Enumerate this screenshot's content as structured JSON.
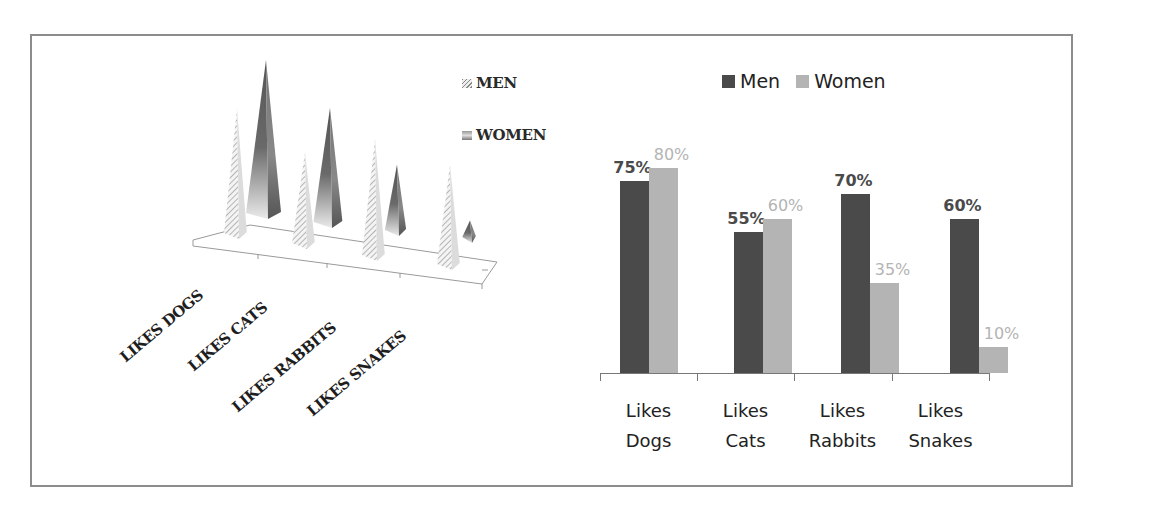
{
  "chart_data": [
    {
      "type": "bar",
      "subtype": "3d-pyramid",
      "title": "",
      "categories": [
        "LIKES DOGS",
        "LIKES CATS",
        "LIKES RABBITS",
        "LIKES SNAKES"
      ],
      "series": [
        {
          "name": "MEN",
          "values": [
            75,
            55,
            70,
            60
          ],
          "style": "hatched"
        },
        {
          "name": "WOMEN",
          "values": [
            80,
            60,
            35,
            10
          ],
          "style": "gradient"
        }
      ],
      "xlabel": "",
      "ylabel": "",
      "grid": false,
      "legend_position": "top-right",
      "data_labels": false
    },
    {
      "type": "bar",
      "title": "",
      "categories": [
        "Likes Dogs",
        "Likes Cats",
        "Likes Rabbits",
        "Likes Snakes"
      ],
      "series": [
        {
          "name": "Men",
          "values": [
            75,
            55,
            70,
            60
          ],
          "color": "#4a4a4a"
        },
        {
          "name": "Women",
          "values": [
            80,
            60,
            35,
            10
          ],
          "color": "#b4b4b4"
        }
      ],
      "value_labels": {
        "Men": [
          "75%",
          "55%",
          "70%",
          "60%"
        ],
        "Women": [
          "80%",
          "60%",
          "35%",
          "10%"
        ]
      },
      "xlabel": "",
      "ylabel": "",
      "ylim": [
        0,
        100
      ],
      "grid": false,
      "legend_position": "top"
    }
  ],
  "left_chart": {
    "legend": [
      {
        "label": "MEN"
      },
      {
        "label": "WOMEN"
      }
    ],
    "categories": [
      "LIKES DOGS",
      "LIKES CATS",
      "LIKES RABBITS",
      "LIKES SNAKES"
    ]
  },
  "right_chart": {
    "legend": [
      {
        "label": "Men",
        "color": "#4a4a4a"
      },
      {
        "label": "Women",
        "color": "#b4b4b4"
      }
    ],
    "categories": [
      {
        "line1": "Likes",
        "line2": "Dogs"
      },
      {
        "line1": "Likes",
        "line2": "Cats"
      },
      {
        "line1": "Likes",
        "line2": "Rabbits"
      },
      {
        "line1": "Likes",
        "line2": "Snakes"
      }
    ],
    "men_labels": [
      "75%",
      "55%",
      "70%",
      "60%"
    ],
    "women_labels": [
      "80%",
      "60%",
      "35%",
      "10%"
    ],
    "men_label_color": "#4a4a4a",
    "women_label_color": "#b4b4b4"
  }
}
